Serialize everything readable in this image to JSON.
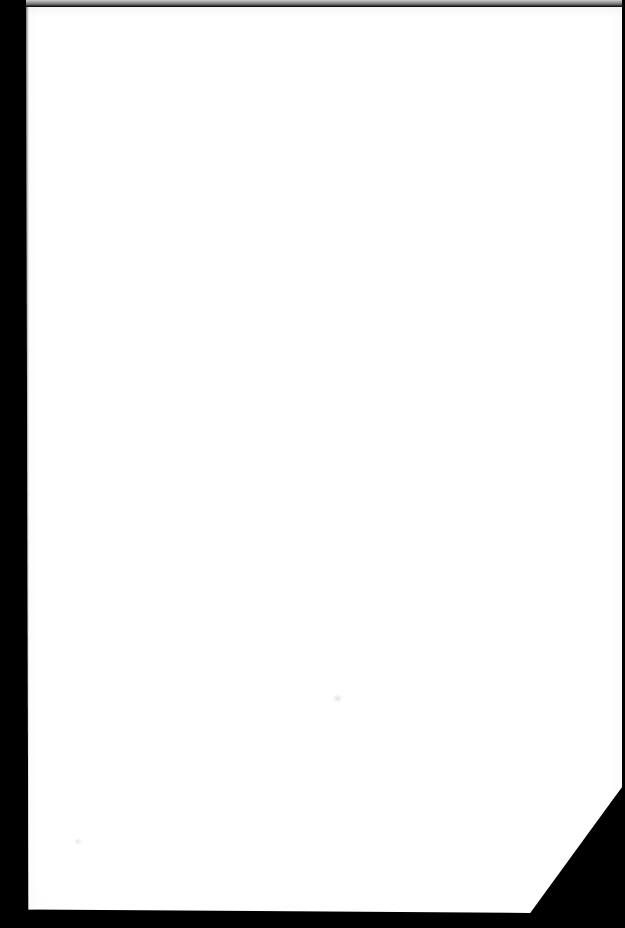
{
  "document": {
    "kind": "scanned-page",
    "title": "Scanned blank page",
    "page_content": "",
    "body_text": "",
    "is_blank": "true",
    "orientation": "portrait",
    "page_number": ""
  },
  "canvas": {
    "width_px": "625",
    "height_px": "928"
  },
  "colors": {
    "backdrop": "#000000",
    "paper": "#ffffff",
    "gutter_band": "#000000",
    "edge_line": "#000000",
    "paper_tint": "#f4f4f6"
  },
  "regions": {
    "paper_sheet": {
      "label": "paper sheet",
      "left_px": "26",
      "top_px": "7",
      "width_px": "596",
      "height_px": "906"
    },
    "left_gutter": {
      "label": "left gutter band",
      "width_px": "26"
    },
    "right_edge": {
      "label": "right edge line",
      "width_px": "3"
    },
    "top_edge": {
      "label": "top edge hairline",
      "height_px": "7"
    },
    "bottom_edge": {
      "label": "bottom edge strip",
      "top_px": "905"
    },
    "corner_cut": {
      "label": "bottom-right corner cut",
      "start_x_px": "530",
      "start_y_px": "913",
      "end_x_px": "625",
      "end_y_px": "787"
    }
  },
  "artifacts": {
    "speck_center": {
      "label": "scan smudge",
      "x_px": "337",
      "y_px": "699"
    },
    "speck_lower_left": {
      "label": "scan speck",
      "x_px": "78",
      "y_px": "842"
    },
    "speck_gutter": {
      "label": "gutter highlight",
      "x_px": "27",
      "y_px": "208"
    }
  }
}
